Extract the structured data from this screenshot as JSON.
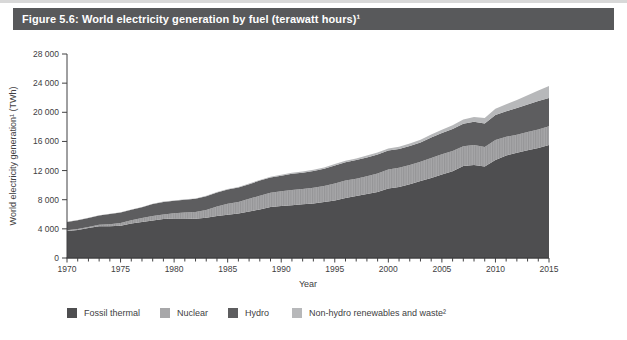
{
  "figure": {
    "title": "Figure 5.6: World electricity generation by fuel (terawatt hours)¹"
  },
  "chart_data": {
    "type": "area",
    "stacked": true,
    "title": "Figure 5.6: World electricity generation by fuel (terawatt hours)¹",
    "xlabel": "Year",
    "ylabel": "World electricity generation¹ (TWh)",
    "xlim": [
      1970,
      2015
    ],
    "ylim": [
      0,
      28000
    ],
    "grid": false,
    "legend_position": "bottom",
    "x": [
      1970,
      1971,
      1972,
      1973,
      1974,
      1975,
      1976,
      1977,
      1978,
      1979,
      1980,
      1981,
      1982,
      1983,
      1984,
      1985,
      1986,
      1987,
      1988,
      1989,
      1990,
      1991,
      1992,
      1993,
      1994,
      1995,
      1996,
      1997,
      1998,
      1999,
      2000,
      2001,
      2002,
      2003,
      2004,
      2005,
      2006,
      2007,
      2008,
      2009,
      2010,
      2011,
      2012,
      2013,
      2014,
      2015
    ],
    "series": [
      {
        "name": "Fossil thermal",
        "color": "#4e4e50",
        "hatch": false,
        "values": [
          3720,
          3860,
          4100,
          4360,
          4370,
          4440,
          4750,
          4940,
          5150,
          5350,
          5420,
          5410,
          5400,
          5530,
          5770,
          5950,
          6100,
          6390,
          6660,
          7000,
          7140,
          7250,
          7380,
          7460,
          7670,
          7910,
          8220,
          8500,
          8800,
          9070,
          9550,
          9750,
          10110,
          10580,
          11000,
          11480,
          11910,
          12620,
          12780,
          12540,
          13450,
          14050,
          14450,
          14800,
          15100,
          15500
        ]
      },
      {
        "name": "Nuclear",
        "color": "#a7a7a9",
        "hatch": true,
        "hatch_color": "#959597",
        "values": [
          80,
          110,
          150,
          200,
          260,
          370,
          440,
          550,
          630,
          640,
          710,
          850,
          930,
          1060,
          1300,
          1490,
          1600,
          1740,
          1890,
          1950,
          2010,
          2100,
          2110,
          2170,
          2230,
          2330,
          2420,
          2390,
          2430,
          2540,
          2590,
          2640,
          2660,
          2640,
          2740,
          2770,
          2790,
          2720,
          2730,
          2700,
          2760,
          2580,
          2460,
          2480,
          2540,
          2570
        ]
      },
      {
        "name": "Hydro",
        "color": "#5d5d5f",
        "hatch": false,
        "values": [
          1160,
          1210,
          1240,
          1270,
          1420,
          1440,
          1430,
          1480,
          1630,
          1700,
          1720,
          1740,
          1790,
          1880,
          1930,
          1950,
          1980,
          2000,
          2070,
          2080,
          2140,
          2210,
          2220,
          2320,
          2350,
          2460,
          2500,
          2550,
          2580,
          2610,
          2620,
          2560,
          2610,
          2650,
          2800,
          2900,
          3010,
          3080,
          3200,
          3240,
          3430,
          3500,
          3660,
          3790,
          3890,
          3890
        ]
      },
      {
        "name": "Non-hydro renewables and waste²",
        "color": "#b7b8ba",
        "hatch": false,
        "values": [
          25,
          27,
          29,
          31,
          33,
          35,
          38,
          41,
          44,
          47,
          51,
          55,
          60,
          65,
          71,
          77,
          84,
          92,
          100,
          110,
          125,
          136,
          147,
          159,
          172,
          186,
          202,
          220,
          240,
          260,
          282,
          306,
          333,
          362,
          398,
          445,
          505,
          575,
          655,
          745,
          855,
          975,
          1115,
          1280,
          1460,
          1650
        ]
      }
    ],
    "y_ticks": {
      "values": [
        0,
        4000,
        8000,
        12000,
        16000,
        20000,
        24000,
        28000
      ],
      "labels": [
        "0",
        "4 000",
        "8 000",
        "12 000",
        "16 000",
        "20 000",
        "24 000",
        "28 000"
      ]
    },
    "x_ticks": {
      "minor_every": 1,
      "major": [
        1970,
        1975,
        1980,
        1985,
        1990,
        1995,
        2000,
        2005,
        2010,
        2015
      ],
      "labels": [
        "1970",
        "1975",
        "1980",
        "1985",
        "1990",
        "1995",
        "2000",
        "2005",
        "2010",
        "2015"
      ]
    }
  },
  "colors": {
    "title_bar_bg": "#58595b",
    "title_text": "#ffffff",
    "axis_line": "#414042",
    "axis_text": "#414042",
    "background": "#ffffff",
    "top_edge_strip": "#d8d8d8"
  }
}
